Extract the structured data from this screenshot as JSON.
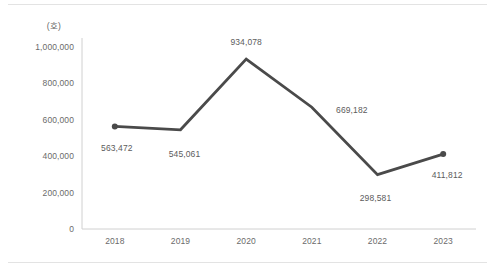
{
  "chart_data": {
    "type": "line",
    "title": "",
    "subtitle": "",
    "xlabel": "",
    "ylabel": "",
    "unit_label": "(호)",
    "categories": [
      "2018",
      "2019",
      "2020",
      "2021",
      "2022",
      "2023"
    ],
    "values": [
      563472,
      545061,
      934078,
      669182,
      298581,
      411812
    ],
    "point_labels": [
      "563,472",
      "545,061",
      "934,078",
      "669,182",
      "298,581",
      "411,812"
    ],
    "series": [
      {
        "name": "",
        "values": [
          563472,
          545061,
          934078,
          669182,
          298581,
          411812
        ]
      }
    ],
    "ylim": [
      0,
      1000000
    ],
    "ytick_values": [
      0,
      200000,
      400000,
      600000,
      800000,
      1000000
    ],
    "ytick_labels": [
      "0",
      "200,000",
      "400,000",
      "600,000",
      "800,000",
      "1,000,000"
    ],
    "grid": false,
    "legend": false,
    "legend_position": "none",
    "line_color": "#4a4a4a",
    "axis_color": "#d0d0d0",
    "text_color": "#6b6b6b",
    "marker_points": [
      "2018",
      "2023"
    ]
  }
}
